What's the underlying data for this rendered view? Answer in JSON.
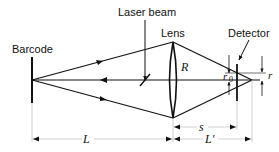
{
  "labels": {
    "laser_beam": "Laser beam",
    "barcode": "Barcode",
    "lens": "Lens",
    "detector": "Detector",
    "lens_radius": "R",
    "r0": "r",
    "r0_subscript": "0",
    "r": "r",
    "L": "L",
    "s": "s",
    "L_prime": "L′"
  },
  "colors": {
    "stroke": "#111111",
    "guide": "#bbbbbb",
    "background": "#ffffff"
  }
}
